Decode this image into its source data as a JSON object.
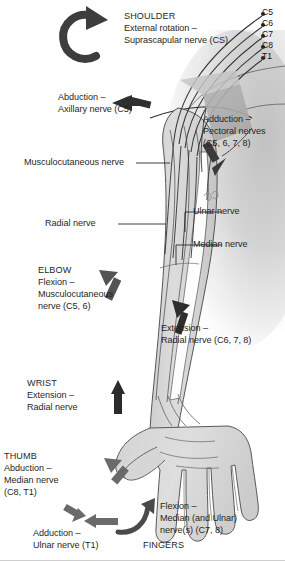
{
  "figure": {
    "background_color": "#ffffff",
    "limb_fill": "#d8d8d8",
    "limb_stroke": "#4a4a4a",
    "torso_shadow_color": "#c9c9c9",
    "plexus_line_color": "#3a3a3a",
    "arrow_color": "#3d3d3d",
    "leader_color": "#2b2b2b",
    "text_color": "#1f1f1f"
  },
  "spinal_roots": {
    "name": "spinal nerve roots",
    "items": [
      {
        "label": "C5"
      },
      {
        "label": "C6"
      },
      {
        "label": "C7"
      },
      {
        "label": "C8"
      },
      {
        "label": "T1"
      }
    ]
  },
  "annotations": {
    "shoulder_external_rotation": {
      "line1": "SHOULDER",
      "line2": "External rotation –",
      "line3": "Suprascapular nerve (CS)"
    },
    "shoulder_abduction": {
      "line1": "Abduction –",
      "line2": "Axillary nerve (C5)"
    },
    "shoulder_adduction": {
      "line1": "Adduction –",
      "line2": "Pectoral nerves",
      "line3": "(C5, 6, 7, 8)"
    },
    "elbow_flexion": {
      "line1": "ELBOW",
      "line2": "Flexion –",
      "line3": "Musculocutaneous",
      "line4": "nerve (C5, 6)"
    },
    "elbow_extension": {
      "line1": "Extension –",
      "line2": "Radial nerve (C6, 7, 8)"
    },
    "wrist_extension": {
      "line1": "WRIST",
      "line2": "Extension –",
      "line3": "Radial nerve"
    },
    "thumb_abduction": {
      "line1": "THUMB",
      "line2": "Abduction –",
      "line3": "Median nerve",
      "line4": "(C8, T1)"
    },
    "finger_adduction": {
      "line1": "Adduction –",
      "line2": "Ulnar nerve (T1)"
    },
    "finger_flexion": {
      "line1": "Flexion –",
      "line2": "Median (and Ulnar)",
      "line3": "nerve(s) (C7, 8)"
    },
    "fingers_heading": {
      "line1": "FINGERS"
    }
  },
  "nerve_labels": {
    "musculocutaneous": "Musculocutaneous nerve",
    "radial": "Radial nerve",
    "ulnar": "Ulnar nerve",
    "median": "Median nerve"
  }
}
